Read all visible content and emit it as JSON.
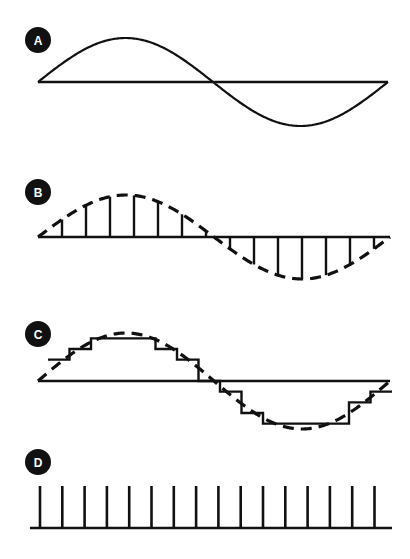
{
  "figure": {
    "width": 410,
    "height": 559,
    "background": "#ffffff",
    "ink_color": "#111111"
  },
  "panels": [
    {
      "id": "A",
      "label": "A",
      "name": "panel-a-analog-sine",
      "description": "Continuous analog sine wave over one full cycle with horizontal axis",
      "badge": {
        "cx": 38,
        "cy": 40,
        "r": 13
      },
      "axis": {
        "x_start": 38,
        "x_end": 388,
        "y": 82
      },
      "wave": {
        "type": "line",
        "x_start": 38,
        "x_end": 388,
        "baseline": 82,
        "amplitude": 44,
        "cycles": 1,
        "dashed": false
      }
    },
    {
      "id": "B",
      "label": "B",
      "name": "panel-b-sampled-pam",
      "description": "Dashed sine wave with vertical sample pulses of varying height (pulse amplitude modulation)",
      "badge": {
        "cx": 38,
        "cy": 192,
        "r": 13
      },
      "axis": {
        "x_start": 38,
        "x_end": 390,
        "y": 237
      },
      "wave": {
        "type": "line",
        "x_start": 38,
        "x_end": 390,
        "baseline": 237,
        "amplitude": 42,
        "cycles": 1,
        "dashed": true
      },
      "samples": {
        "count": 14,
        "first_x": 62,
        "spacing": 24
      }
    },
    {
      "id": "C",
      "label": "C",
      "name": "panel-c-quantized-staircase",
      "description": "Quantized staircase approximation drawn over the dashed sine wave",
      "badge": {
        "cx": 38,
        "cy": 334,
        "r": 13
      },
      "axis": {
        "x_start": 38,
        "x_end": 390,
        "y": 381
      },
      "wave": {
        "type": "line",
        "x_start": 38,
        "x_end": 390,
        "baseline": 381,
        "amplitude": 48,
        "cycles": 1,
        "dashed": true
      },
      "steps": {
        "count": 16,
        "first_x": 48,
        "width": 21.5
      }
    },
    {
      "id": "D",
      "label": "D",
      "name": "panel-d-clock-pulse-train",
      "description": "Uniform clock pulse train of equal-height vertical pulses on a baseline",
      "badge": {
        "cx": 38,
        "cy": 462,
        "r": 13
      },
      "axis": {
        "x_start": 30,
        "x_end": 392,
        "y": 528
      },
      "pulses": {
        "count": 16,
        "first_x": 40,
        "spacing": 22.3,
        "height": 42
      }
    }
  ]
}
